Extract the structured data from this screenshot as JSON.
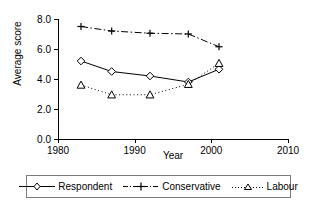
{
  "chart_data": {
    "type": "line",
    "title": "",
    "xlabel": "Year",
    "ylabel": "Average score",
    "xlim": [
      1980,
      2010
    ],
    "ylim": [
      0.0,
      8.0
    ],
    "xticks": [
      1980,
      1990,
      2000,
      2010
    ],
    "xtick_labels": [
      "1980",
      "1990",
      "2000",
      "2010"
    ],
    "yticks": [
      0.0,
      2.0,
      4.0,
      6.0,
      8.0
    ],
    "ytick_labels": [
      "0.0",
      "2.0",
      "4.0",
      "6.0",
      "8.0"
    ],
    "grid": false,
    "legend_position": "below",
    "x": [
      1983,
      1987,
      1992,
      1997,
      2001
    ],
    "series": [
      {
        "name": "Respondent",
        "values": [
          5.2,
          4.5,
          4.2,
          3.8,
          4.65
        ],
        "marker": "diamond",
        "linestyle": "solid",
        "color": "#000000"
      },
      {
        "name": "Conservative",
        "values": [
          7.5,
          7.2,
          7.05,
          7.0,
          6.15
        ],
        "marker": "plus",
        "linestyle": "dashdot",
        "color": "#000000"
      },
      {
        "name": "Labour",
        "values": [
          3.6,
          2.95,
          2.95,
          3.65,
          5.05
        ],
        "marker": "triangle",
        "linestyle": "dotted",
        "color": "#000000"
      }
    ]
  },
  "legend": {
    "entries": [
      {
        "label": "Respondent"
      },
      {
        "label": "Conservative"
      },
      {
        "label": "Labour"
      }
    ]
  }
}
